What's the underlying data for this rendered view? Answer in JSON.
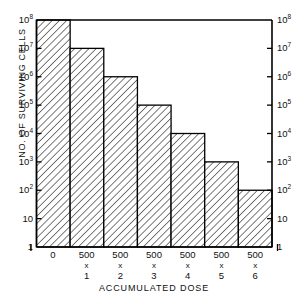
{
  "chart_data": {
    "type": "bar",
    "title": "",
    "subtitle": "",
    "xlabel": "ACCUMULATED DOSE",
    "ylabel": "NO. OF SURVIVING CELLS",
    "yscale": "log",
    "ylim": [
      1,
      100000000
    ],
    "grid": false,
    "legend": null,
    "categories": [
      "0",
      "500 x 1",
      "500 x 2",
      "500 x 3",
      "500 x 4",
      "500 x 5",
      "500 x 6"
    ],
    "values": [
      100000000,
      10000000,
      1000000,
      100000,
      10000,
      1000,
      100
    ],
    "value_labels": [
      "10^8",
      "10^7",
      "10^6",
      "10^5",
      "10^4",
      "10^3",
      "10^2"
    ],
    "ytick_values": [
      1,
      10,
      100,
      1000,
      10000,
      100000,
      1000000,
      10000000,
      100000000
    ],
    "ytick_labels": [
      "1",
      "10",
      "10^2",
      "10^3",
      "10^4",
      "10^5",
      "10^6",
      "10^7",
      "10^8"
    ],
    "bar_fill": "diagonal-hatch",
    "bar_edge_color": "#000000",
    "axis_color": "#000000",
    "background_color": "#ffffff"
  },
  "axes": {
    "y_ticks": [
      {
        "label_mantissa": "10",
        "label_exponent": "8",
        "value": 100000000
      },
      {
        "label_mantissa": "10",
        "label_exponent": "7",
        "value": 10000000
      },
      {
        "label_mantissa": "10",
        "label_exponent": "6",
        "value": 1000000
      },
      {
        "label_mantissa": "10",
        "label_exponent": "5",
        "value": 100000
      },
      {
        "label_mantissa": "10",
        "label_exponent": "4",
        "value": 10000
      },
      {
        "label_mantissa": "10",
        "label_exponent": "3",
        "value": 1000
      },
      {
        "label_mantissa": "10",
        "label_exponent": "2",
        "value": 100
      },
      {
        "label_mantissa": "10",
        "label_exponent": "",
        "value": 10
      },
      {
        "label_mantissa": "1",
        "label_exponent": "",
        "value": 1
      }
    ],
    "x_ticks": [
      {
        "value": "0",
        "operator": "x",
        "multiplier": ""
      },
      {
        "value": "500",
        "operator": "x",
        "multiplier": "1"
      },
      {
        "value": "500",
        "operator": "x",
        "multiplier": "2"
      },
      {
        "value": "500",
        "operator": "x",
        "multiplier": "3"
      },
      {
        "value": "500",
        "operator": "x",
        "multiplier": "4"
      },
      {
        "value": "500",
        "operator": "x",
        "multiplier": "5"
      },
      {
        "value": "500",
        "operator": "x",
        "multiplier": "6"
      }
    ]
  }
}
